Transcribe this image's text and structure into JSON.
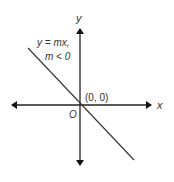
{
  "diagram": {
    "axes": {
      "x_label": "x",
      "y_label": "y",
      "origin_label": "O",
      "origin_coord_label": "(0, 0)"
    },
    "line": {
      "equation_label": "y = mx,",
      "condition_label": "m < 0",
      "slope_sign": "negative",
      "passes_through": "(0, 0)"
    },
    "colors": {
      "axis": "#222222",
      "line": "#333333",
      "text": "#333333"
    }
  }
}
